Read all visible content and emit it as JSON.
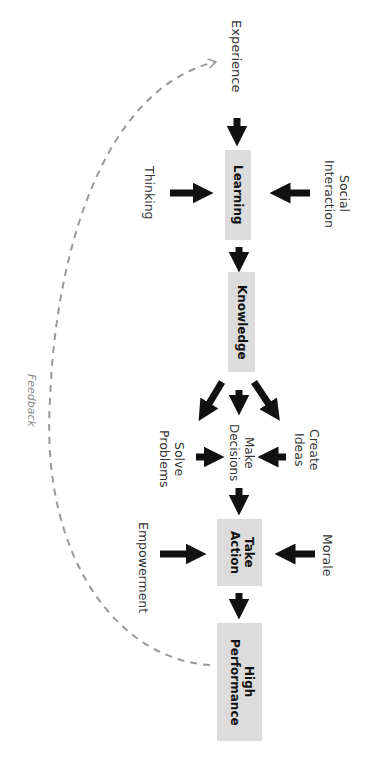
{
  "diagram": {
    "orientation": "rotated 90 degrees clockwise",
    "nodes": {
      "experience": "Experience",
      "learning": "Learning",
      "knowledge": "Knowledge",
      "make_decisions": "Make Decisions",
      "take_action": "Take Action",
      "high_performance": "High Performance"
    },
    "inputs": {
      "thinking": "Thinking",
      "social_interaction": "Social Interaction",
      "solve_problems": "Solve Problems",
      "create_ideas": "Create Ideas",
      "empowerment": "Empowerment",
      "morale": "Morale"
    },
    "feedback_label": "Feedback",
    "colors": {
      "box_fill": "#dcdcdc",
      "arrow": "#111111",
      "feedback": "#9a9a9a",
      "text": "#333333"
    },
    "edges": [
      [
        "Experience",
        "Learning"
      ],
      [
        "Thinking",
        "Learning"
      ],
      [
        "Social Interaction",
        "Learning"
      ],
      [
        "Learning",
        "Knowledge"
      ],
      [
        "Knowledge",
        "Solve Problems"
      ],
      [
        "Knowledge",
        "Make Decisions"
      ],
      [
        "Knowledge",
        "Create Ideas"
      ],
      [
        "Solve Problems",
        "Make Decisions"
      ],
      [
        "Create Ideas",
        "Make Decisions"
      ],
      [
        "Make Decisions",
        "Take Action"
      ],
      [
        "Empowerment",
        "Take Action"
      ],
      [
        "Morale",
        "Take Action"
      ],
      [
        "Take Action",
        "High Performance"
      ],
      [
        "High Performance",
        "Experience",
        "Feedback (dashed)"
      ]
    ]
  }
}
